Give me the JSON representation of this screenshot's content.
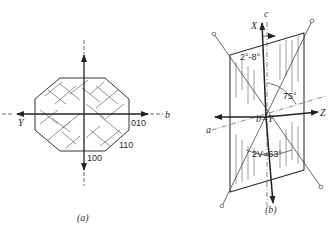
{
  "figure": {
    "panel_a": {
      "caption": "(a)",
      "axis_labels": {
        "left": "Y",
        "right": "b"
      },
      "face_labels": [
        "010",
        "110",
        "100"
      ]
    },
    "panel_b": {
      "caption": "(b)",
      "axis_labels": {
        "c": "c",
        "x": "X",
        "z": "Z",
        "a": "a",
        "center": "b=Y"
      },
      "angle_labels": {
        "extinction": "2°-8°",
        "angle_75": "75°",
        "optic_angle": "2V=63°"
      }
    }
  },
  "colors": {
    "ink": "#2a2a2a",
    "hatch": "#555555",
    "background": "#ffffff"
  }
}
